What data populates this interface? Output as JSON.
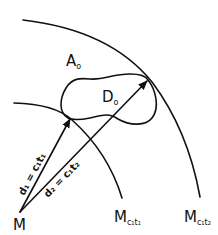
{
  "diagram": {
    "type": "geometric-illustration",
    "colors": {
      "ink": "#111111",
      "background": "#ffffff"
    },
    "point": {
      "label": "M"
    },
    "area": {
      "label": "A",
      "subscript": "o"
    },
    "region": {
      "label": "D",
      "subscript": "o"
    },
    "arcs": [
      {
        "id": "inner",
        "label": "M",
        "subscript": "c₁t₁"
      },
      {
        "id": "outer",
        "label": "M",
        "subscript": "c₁t₂"
      }
    ],
    "arrows": [
      {
        "id": "d1",
        "label": "d₁ = c₁t₁"
      },
      {
        "id": "d2",
        "label": "d₂ = c₁t₂"
      }
    ]
  }
}
